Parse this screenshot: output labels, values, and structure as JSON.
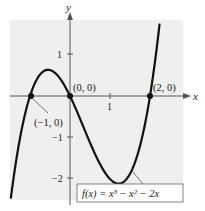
{
  "chart_data": {
    "type": "line",
    "title": "",
    "function_label": "f(x) = x³ − x² − 2x",
    "xlabel": "x",
    "ylabel": "y",
    "xlim": [
      -1.55,
      2.75
    ],
    "ylim": [
      -2.55,
      1.85
    ],
    "x_ticks": [
      {
        "value": 1,
        "label": "1"
      }
    ],
    "y_ticks": [
      {
        "value": 1,
        "label": "1"
      },
      {
        "value": -1,
        "label": "−1"
      },
      {
        "value": -2,
        "label": "−2"
      }
    ],
    "series": [
      {
        "name": "f(x) = x^3 - x^2 - 2x",
        "x": [
          -1.5,
          -1.25,
          -1.0,
          -0.75,
          -0.55,
          -0.25,
          0.0,
          0.25,
          0.5,
          0.75,
          1.0,
          1.22,
          1.5,
          1.75,
          2.0,
          2.25,
          2.5
        ],
        "values": [
          -2.625,
          -0.953,
          0.0,
          0.422,
          0.631,
          0.422,
          0.0,
          -0.547,
          -1.125,
          -1.641,
          -2.0,
          -2.113,
          -1.875,
          -1.016,
          0.0,
          1.453,
          3.125
        ]
      }
    ],
    "points": [
      {
        "x": -1,
        "y": 0,
        "label": "(−1, 0)"
      },
      {
        "x": 0,
        "y": 0,
        "label": "(0, 0)"
      },
      {
        "x": 2,
        "y": 0,
        "label": "(2, 0)"
      }
    ],
    "grid": false,
    "legend": "none"
  },
  "colors": {
    "panel": "#efefef",
    "curve": "#111111",
    "axis": "#555555",
    "text": "#222222"
  }
}
